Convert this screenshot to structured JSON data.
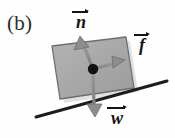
{
  "figure": {
    "panel_label": "(b)",
    "background_color": "#fefefe",
    "block": {
      "name": "block",
      "fill_color": "#a8a8a8",
      "edge_color": "#6e6e6e",
      "shadow_color": "#bdbdbd",
      "corners": [
        [
          52,
          46
        ],
        [
          126,
          37
        ],
        [
          134,
          88
        ],
        [
          60,
          99
        ]
      ]
    },
    "incline": {
      "name": "incline-surface",
      "color": "#1d1d1d",
      "start": [
        36,
        117
      ],
      "end": [
        167,
        81
      ],
      "thickness": 3
    },
    "pivot": {
      "name": "center-of-mass-dot",
      "color": "#111111",
      "center": [
        93,
        69
      ],
      "radius": 5.2
    },
    "vectors": [
      {
        "id": "normal",
        "symbol": "n",
        "label": "n",
        "accent": "arrow",
        "description": "normal force, perpendicular to incline surface, pointing up-left",
        "color": "#8d8d8d",
        "tail": [
          93,
          69
        ],
        "tip": [
          80,
          36
        ],
        "label_position": [
          70,
          8
        ]
      },
      {
        "id": "friction",
        "symbol": "f",
        "label": "f",
        "accent": "arrow",
        "description": "friction force, parallel to incline surface, pointing up-right",
        "color": "#8d8d8d",
        "tail": [
          93,
          69
        ],
        "tip": [
          125,
          60
        ],
        "label_position": [
          132,
          31
        ]
      },
      {
        "id": "weight",
        "symbol": "w",
        "label": "w",
        "accent": "arrow",
        "description": "weight force, vertically downward",
        "color": "#8d8d8d",
        "tail": [
          93,
          69
        ],
        "tip": [
          95,
          117
        ],
        "label_position": [
          104,
          104
        ]
      }
    ]
  }
}
